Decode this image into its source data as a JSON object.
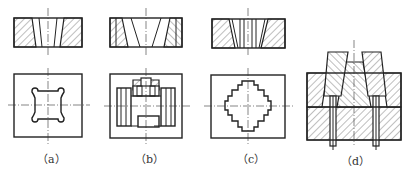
{
  "figure": {
    "panels": [
      {
        "id": "a",
        "label": "（a）",
        "description": "Die with dog-bone shaped opening (section and plan view)"
      },
      {
        "id": "b",
        "label": "（b）",
        "description": "Die with multiple rectangular openings and insert (section and plan view)"
      },
      {
        "id": "c",
        "label": "（c）",
        "description": "Die with stepped cross-shaped opening (section and plan view)"
      },
      {
        "id": "d",
        "label": "（d）",
        "description": "Assembled die with tapered inserts and ejector pins (section view)"
      }
    ],
    "colors": {
      "line": "#222222",
      "background": "#ffffff"
    }
  }
}
